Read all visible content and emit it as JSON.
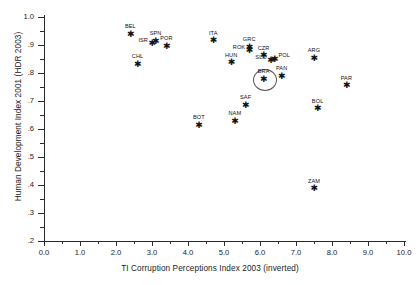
{
  "chart_data": {
    "type": "scatter",
    "title": "",
    "xlabel": "TI Corruption Perceptions Index 2003 (inverted)",
    "ylabel": "Human Development Index 2001 (HDR 2003)",
    "xlim": [
      0.0,
      10.0
    ],
    "ylim": [
      0.2,
      1.0
    ],
    "grid": false,
    "legend": "none",
    "xticks": [
      "0.0",
      "1.0",
      "2.0",
      "3.0",
      "4.0",
      "5.0",
      "6.0",
      "7.0",
      "8.0",
      "9.0",
      "10.0"
    ],
    "xtick_values": [
      0,
      1,
      2,
      3,
      4,
      5,
      6,
      7,
      8,
      9,
      10
    ],
    "yticks": [
      "1.0",
      ".9",
      ".8",
      ".7",
      ".6",
      ".5",
      ".4",
      ".3",
      ".2"
    ],
    "ytick_values": [
      1.0,
      0.9,
      0.8,
      0.7,
      0.6,
      0.5,
      0.4,
      0.3,
      0.2
    ],
    "marker": "asterisk",
    "points": [
      {
        "label": "BEL",
        "x": 2.4,
        "y": 0.939,
        "lpos": "top"
      },
      {
        "label": "CHL",
        "x": 2.6,
        "y": 0.831,
        "lpos": "top"
      },
      {
        "label": "ISR",
        "x": 3.0,
        "y": 0.905,
        "lpos": "left"
      },
      {
        "label": "SPN",
        "x": 3.1,
        "y": 0.913,
        "lpos": "top"
      },
      {
        "label": "POR",
        "x": 3.4,
        "y": 0.896,
        "lpos": "top"
      },
      {
        "label": "BOT",
        "x": 4.3,
        "y": 0.614,
        "lpos": "top"
      },
      {
        "label": "ITA",
        "x": 4.7,
        "y": 0.916,
        "lpos": "top"
      },
      {
        "label": "NAM",
        "x": 5.3,
        "y": 0.627,
        "lpos": "top"
      },
      {
        "label": "HUN",
        "x": 5.2,
        "y": 0.837,
        "lpos": "top"
      },
      {
        "label": "SAF",
        "x": 5.6,
        "y": 0.684,
        "lpos": "top"
      },
      {
        "label": "GRC",
        "x": 5.7,
        "y": 0.892,
        "lpos": "top"
      },
      {
        "label": "ROK",
        "x": 5.7,
        "y": 0.879,
        "lpos": "left"
      },
      {
        "label": "CZR",
        "x": 6.1,
        "y": 0.861,
        "lpos": "top"
      },
      {
        "label": "POL",
        "x": 6.4,
        "y": 0.85,
        "lpos": "right"
      },
      {
        "label": "SLO",
        "x": 6.3,
        "y": 0.843,
        "lpos": "left"
      },
      {
        "label": "BRA",
        "x": 6.1,
        "y": 0.777,
        "lpos": "top",
        "highlight": true
      },
      {
        "label": "PAN",
        "x": 6.6,
        "y": 0.788,
        "lpos": "top"
      },
      {
        "label": "ARG",
        "x": 7.5,
        "y": 0.853,
        "lpos": "top"
      },
      {
        "label": "BOL",
        "x": 7.6,
        "y": 0.672,
        "lpos": "top"
      },
      {
        "label": "ZAM",
        "x": 7.5,
        "y": 0.386,
        "lpos": "top"
      },
      {
        "label": "PAR",
        "x": 8.4,
        "y": 0.755,
        "lpos": "top"
      }
    ]
  }
}
